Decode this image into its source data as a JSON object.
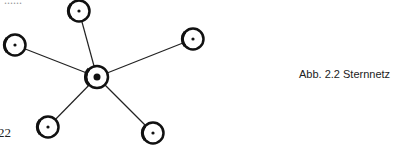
{
  "figure": {
    "caption": "Abb. 2.2 Sternnetz",
    "page_number": "22",
    "cutoff_text": "......"
  },
  "diagram": {
    "type": "star-network",
    "hub": {
      "id": "center",
      "x": 97,
      "y": 77
    },
    "nodes": [
      {
        "id": "top",
        "x": 79,
        "y": 11
      },
      {
        "id": "left",
        "x": 15,
        "y": 45
      },
      {
        "id": "right",
        "x": 193,
        "y": 39
      },
      {
        "id": "bottom-left",
        "x": 48,
        "y": 127
      },
      {
        "id": "bottom-right",
        "x": 153,
        "y": 133
      }
    ]
  }
}
